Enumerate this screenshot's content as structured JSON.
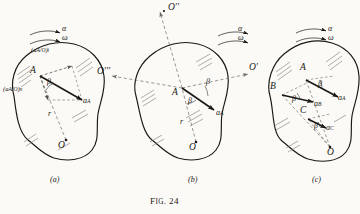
{
  "figure": {
    "caption_prefix": "F",
    "caption_smallcaps": "IG",
    "caption_rest": ". 24",
    "caption_full": "Fig. 24",
    "ink_color": "#1a1714",
    "paper_color": "#fbfaf7",
    "dash_color": "#6d6a64"
  },
  "panels": [
    {
      "id": "a",
      "label": "(a)",
      "rotation": {
        "alpha": "α",
        "omega": "ω"
      },
      "points": [
        {
          "name": "A",
          "label": "A"
        },
        {
          "name": "O",
          "label": "O"
        }
      ],
      "radius_label": "r",
      "angle_label": "β",
      "vectors": [
        {
          "name": "a-A-over-O-tangential",
          "base": "(a",
          "sub": "A/O",
          "close": ")",
          "comp": "t"
        },
        {
          "name": "a-A-over-O-normal",
          "base": "(a",
          "sub": "A/O",
          "close": ")",
          "comp": "n"
        },
        {
          "name": "a-A-resultant",
          "base": "a",
          "sub": "A"
        }
      ]
    },
    {
      "id": "b",
      "label": "(b)",
      "rotation": {
        "alpha": "α",
        "omega": "ω"
      },
      "points": [
        {
          "name": "A",
          "label": "A"
        },
        {
          "name": "O",
          "label": "O"
        }
      ],
      "axes": [
        {
          "name": "O-double-prime",
          "label": "O′′"
        },
        {
          "name": "O-prime",
          "label": "O′"
        },
        {
          "name": "O-triple-prime",
          "label": "O′′′"
        }
      ],
      "radius_label": "r",
      "angle_labels": [
        "β",
        "β"
      ],
      "vectors": [
        {
          "name": "a-A-resultant",
          "base": "a",
          "sub": "A"
        }
      ]
    },
    {
      "id": "c",
      "label": "(c)",
      "rotation": {
        "alpha": "α",
        "omega": "ω"
      },
      "points": [
        {
          "name": "A",
          "label": "A"
        },
        {
          "name": "B",
          "label": "B"
        },
        {
          "name": "C",
          "label": "C"
        },
        {
          "name": "O",
          "label": "O"
        }
      ],
      "angle_labels": [
        "β",
        "β",
        "β"
      ],
      "vectors": [
        {
          "name": "a-A",
          "base": "a",
          "sub": "A"
        },
        {
          "name": "a-B",
          "base": "a",
          "sub": "B"
        },
        {
          "name": "a-C",
          "base": "a",
          "sub": "C"
        }
      ]
    }
  ]
}
